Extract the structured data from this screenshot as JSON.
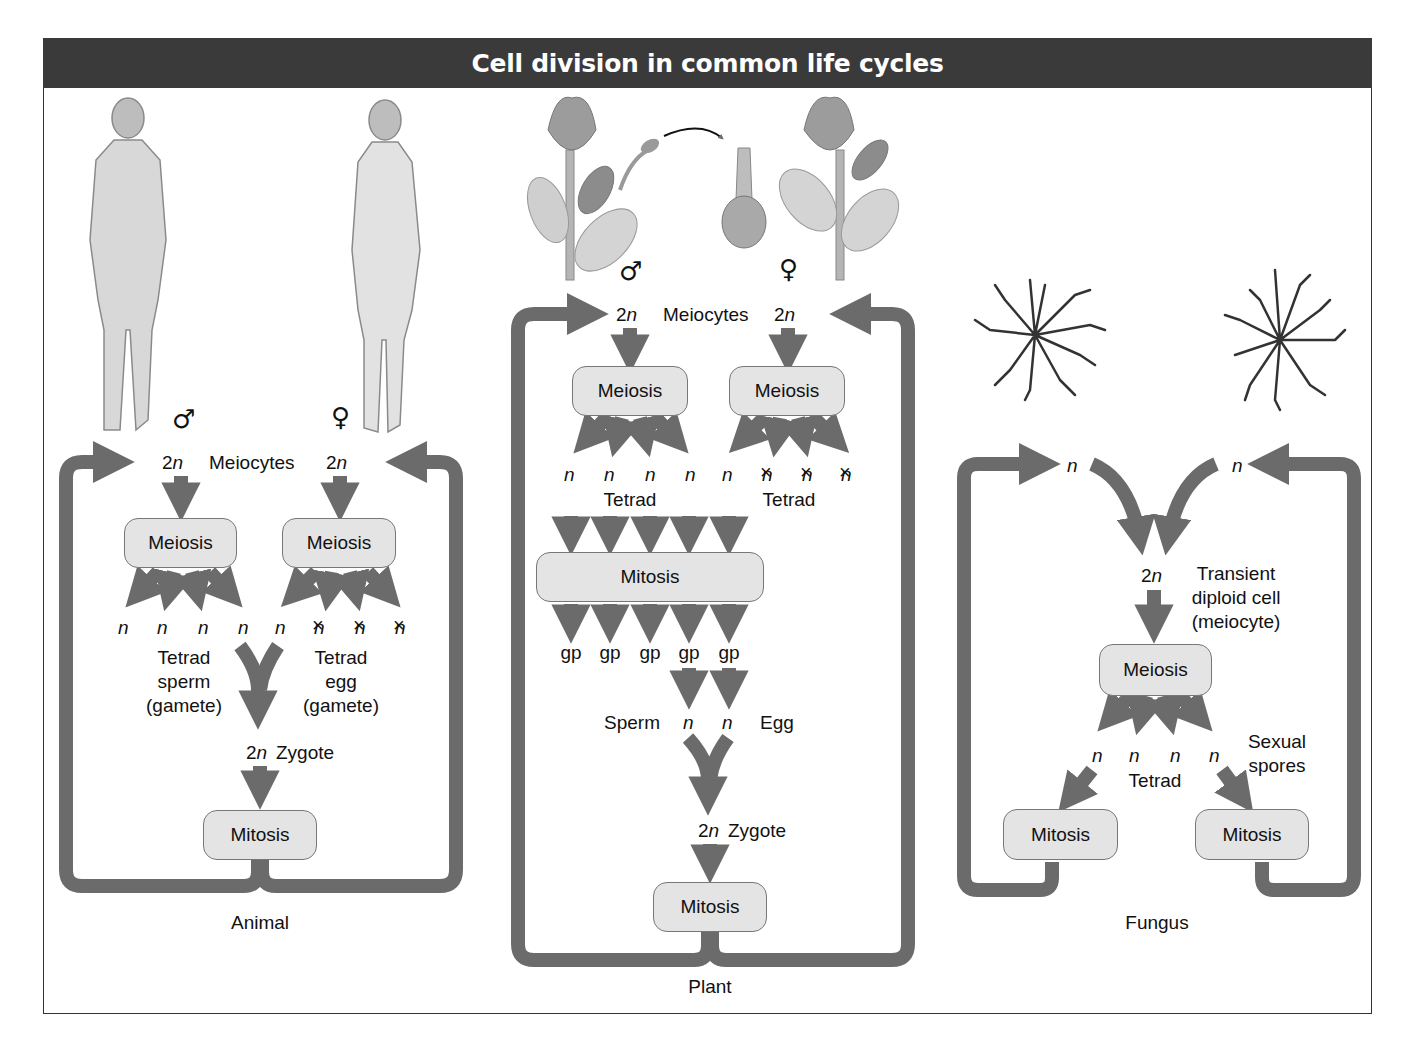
{
  "title": "Cell division in common life cycles",
  "colors": {
    "title_bar": "#3a3a3a",
    "arrow": "#6b6b6b",
    "box_fill": "#e4e4e4",
    "box_border": "#777777"
  },
  "symbols": {
    "male": "♂",
    "female": "♀",
    "haploid": "n",
    "diploid_prefix": "2",
    "aborted_marker": "×"
  },
  "animal": {
    "caption": "Animal",
    "male_symbol": "♂",
    "female_symbol": "♀",
    "meiocyte_left": "2n",
    "meiocytes_label": "Meiocytes",
    "meiocyte_right": "2n",
    "meiosis_left": "Meiosis",
    "meiosis_right": "Meiosis",
    "products": [
      "n",
      "n",
      "n",
      "n",
      "n",
      "n",
      "n",
      "n"
    ],
    "aborted_indices": [
      5,
      6,
      7
    ],
    "tetrad_sperm": [
      "Tetrad",
      "sperm",
      "(gamete)"
    ],
    "tetrad_egg": [
      "Tetrad",
      "egg",
      "(gamete)"
    ],
    "zygote_ploidy": "2n",
    "zygote_label": "Zygote",
    "mitosis": "Mitosis"
  },
  "plant": {
    "caption": "Plant",
    "male_symbol": "♂",
    "female_symbol": "♀",
    "meiocyte_left": "2n",
    "meiocytes_label": "Meiocytes",
    "meiocyte_right": "2n",
    "meiosis_left": "Meiosis",
    "meiosis_right": "Meiosis",
    "products": [
      "n",
      "n",
      "n",
      "n",
      "n",
      "n",
      "n",
      "n"
    ],
    "aborted_indices": [
      5,
      6,
      7
    ],
    "tetrad_left": "Tetrad",
    "tetrad_right": "Tetrad",
    "mitosis_wide": "Mitosis",
    "gametophytes": [
      "gp",
      "gp",
      "gp",
      "gp",
      "gp"
    ],
    "sperm_label": "Sperm",
    "sperm_ploidy": "n",
    "egg_ploidy": "n",
    "egg_label": "Egg",
    "zygote_ploidy": "2n",
    "zygote_label": "Zygote",
    "mitosis": "Mitosis"
  },
  "fungus": {
    "caption": "Fungus",
    "left_ploidy": "n",
    "right_ploidy": "n",
    "diploid_ploidy": "2n",
    "diploid_desc": [
      "Transient",
      "diploid cell",
      "(meiocyte)"
    ],
    "meiosis": "Meiosis",
    "products": [
      "n",
      "n",
      "n",
      "n"
    ],
    "tetrad": "Tetrad",
    "spores_label": [
      "Sexual",
      "spores"
    ],
    "mitosis_left": "Mitosis",
    "mitosis_right": "Mitosis"
  }
}
